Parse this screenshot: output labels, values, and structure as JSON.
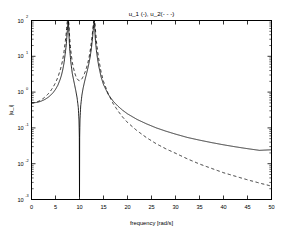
{
  "figure": {
    "title": "u_1 (-),  u_2(- - -)",
    "background": "#ffffff",
    "axes_color": "#000000"
  },
  "axis": {
    "xlabel": "frequency [rad/s]",
    "ylabel": "|u_i|",
    "x_ticks": [
      "0",
      "5",
      "10",
      "15",
      "20",
      "25",
      "30",
      "35",
      "40",
      "45",
      "50"
    ],
    "y_ticks": [
      "10",
      "10",
      "10",
      "10",
      "10",
      "10"
    ],
    "y_tick_exponents": [
      "2",
      "1",
      "0",
      "-1",
      "-2",
      "-3"
    ]
  },
  "chart_data": {
    "type": "line",
    "title": "u_1 (-),  u_2(- - -)",
    "xlabel": "frequency [rad/s]",
    "ylabel": "|u_i|",
    "xlim": [
      0,
      50
    ],
    "ylim": [
      0.001,
      100
    ],
    "yscale": "log",
    "xscale": "linear",
    "grid": false,
    "legend": "in-title",
    "xticks": [
      0,
      5,
      10,
      15,
      20,
      25,
      30,
      35,
      40,
      45,
      50
    ],
    "yticks": [
      0.001,
      0.01,
      0.1,
      1,
      10,
      100
    ],
    "annotations": {
      "resonance_1": 7.65,
      "resonance_2": 13.07,
      "antiresonance_u1": 10.0
    },
    "series": [
      {
        "name": "u_1",
        "style": "solid",
        "color": "#000000",
        "x": [
          0,
          0.5,
          1,
          1.5,
          2,
          2.5,
          3,
          3.5,
          4,
          4.5,
          5,
          5.5,
          6,
          6.25,
          6.5,
          6.75,
          7,
          7.2,
          7.4,
          7.5,
          7.6,
          7.65,
          7.7,
          7.8,
          7.9,
          8,
          8.2,
          8.5,
          8.75,
          9,
          9.25,
          9.5,
          9.75,
          9.9,
          9.97,
          10,
          10.03,
          10.1,
          10.25,
          10.5,
          10.75,
          11,
          11.25,
          11.5,
          11.75,
          12,
          12.25,
          12.5,
          12.75,
          12.9,
          13,
          13.05,
          13.07,
          13.1,
          13.2,
          13.3,
          13.5,
          13.75,
          14,
          14.5,
          15,
          16,
          17,
          18,
          19,
          20,
          22,
          24,
          26,
          28,
          30,
          32.5,
          35,
          37.5,
          40,
          42.5,
          45,
          47.5,
          50
        ],
        "y": [
          0.5,
          0.503,
          0.513,
          0.531,
          0.558,
          0.596,
          0.648,
          0.72,
          0.82,
          0.965,
          1.19,
          1.56,
          2.32,
          2.99,
          4.12,
          6.2,
          11.2,
          18.5,
          39,
          62,
          90,
          100,
          88,
          42,
          22,
          13.5,
          6.8,
          3.3,
          2.25,
          1.55,
          1.06,
          0.69,
          0.37,
          0.16,
          0.05,
          0.0012,
          0.05,
          0.17,
          0.41,
          0.82,
          1.28,
          1.82,
          2.5,
          3.4,
          4.7,
          6.7,
          10.2,
          17.5,
          36,
          62,
          88,
          97,
          100,
          92,
          52,
          30,
          15.5,
          8.6,
          5.4,
          2.65,
          1.62,
          0.86,
          0.56,
          0.405,
          0.31,
          0.247,
          0.172,
          0.129,
          0.1,
          0.081,
          0.067,
          0.054,
          0.0455,
          0.0389,
          0.0337,
          0.0296,
          0.0263,
          0.0236,
          0.0245
        ]
      },
      {
        "name": "u_2",
        "style": "dashed",
        "color": "#000000",
        "x": [
          0,
          0.5,
          1,
          1.5,
          2,
          2.5,
          3,
          3.5,
          4,
          4.5,
          5,
          5.5,
          6,
          6.25,
          6.5,
          6.75,
          7,
          7.2,
          7.4,
          7.5,
          7.6,
          7.65,
          7.7,
          7.8,
          7.9,
          8,
          8.2,
          8.5,
          8.75,
          9,
          9.25,
          9.5,
          9.75,
          10,
          10.25,
          10.5,
          10.75,
          11,
          11.25,
          11.5,
          11.75,
          12,
          12.25,
          12.5,
          12.75,
          12.9,
          13,
          13.05,
          13.07,
          13.1,
          13.2,
          13.3,
          13.5,
          13.75,
          14,
          14.5,
          15,
          16,
          17,
          18,
          19,
          20,
          22,
          24,
          26,
          28,
          30,
          32.5,
          35,
          37.5,
          40,
          42.5,
          45,
          47.5,
          50
        ],
        "y": [
          0.5,
          0.506,
          0.524,
          0.556,
          0.605,
          0.673,
          0.768,
          0.9,
          1.09,
          1.37,
          1.82,
          2.6,
          4.2,
          5.6,
          8.0,
          12.5,
          23,
          39,
          80,
          100,
          100,
          100,
          100,
          78,
          43,
          27,
          13.6,
          6.8,
          4.7,
          3.45,
          2.75,
          2.35,
          2.15,
          2.08,
          2.15,
          2.35,
          2.7,
          3.2,
          3.9,
          5.0,
          6.6,
          9.4,
          15,
          26,
          52,
          86,
          100,
          100,
          100,
          100,
          92,
          60,
          28,
          14.5,
          8.5,
          3.6,
          2.0,
          0.88,
          0.48,
          0.3,
          0.2,
          0.142,
          0.083,
          0.053,
          0.036,
          0.026,
          0.0196,
          0.0136,
          0.0098,
          0.0074,
          0.0056,
          0.00445,
          0.00355,
          0.00288,
          0.00236
        ]
      }
    ]
  }
}
